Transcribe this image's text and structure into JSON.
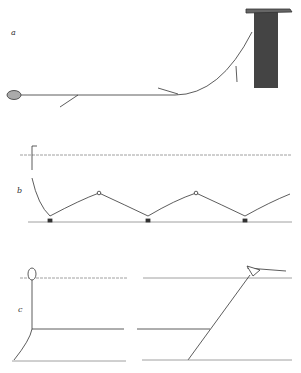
{
  "panels": [
    {
      "id": "a",
      "label": "a",
      "description": "Line anchored by stone on seabed rising to floating net/gear bundle"
    },
    {
      "id": "b",
      "label": "b",
      "description": "Bottom longline with buoy floats and anchored sinkers, hooks on droppers"
    },
    {
      "id": "c",
      "label": "c",
      "description": "Longline set with buoy and anchor (left) and line to boat (right)"
    }
  ],
  "colors": {
    "ink": "#333333",
    "background": "#ffffff",
    "surface": "#888888"
  }
}
